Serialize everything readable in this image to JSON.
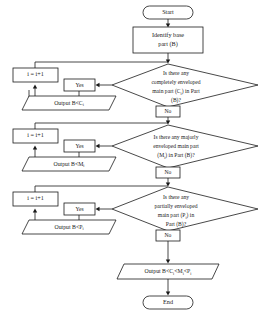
{
  "diagram": {
    "colors": {
      "stroke": "#1a1a1a",
      "fill": "#ffffff",
      "text": "#1a1a1a"
    }
  },
  "nodes": {
    "start": {
      "label": "Start"
    },
    "identify": {
      "line1": "Identify  base",
      "line2": "part (B)"
    },
    "decision1": {
      "line1": "Is  there  any",
      "line2": "completely   enveloped",
      "line3": "main part (C",
      "line3_sub": "i",
      "line3_end": ") in Part",
      "line4": "(B)?"
    },
    "decision2": {
      "line1": "Is  there  any  majorly",
      "line2": "enveloped   main  part",
      "line3": "(M",
      "line3_sub": "i",
      "line3_end": ") in Part (B)?"
    },
    "decision3": {
      "line1": "Is  there  any",
      "line2": "partially   enveloped",
      "line3": "main  part  (P",
      "line3_sub": "i",
      "line3_end": ")  in",
      "line4": "Part (B)?"
    },
    "increment1": {
      "label": "i = i+1"
    },
    "increment2": {
      "label": "i = i+1"
    },
    "increment3": {
      "label": "i = i+1"
    },
    "output1": {
      "label": "Output  B<C",
      "sub": "i"
    },
    "output2": {
      "label": "Output  B<M",
      "sub": "i"
    },
    "output3": {
      "label": "Output  B<P",
      "sub": "i"
    },
    "output_final": {
      "part1": "Output B<C",
      "sub1": "i",
      "part2": "<M",
      "sub2": "i",
      "part3": "<P",
      "sub3": "i"
    },
    "end": {
      "label": "End"
    }
  },
  "edge_labels": {
    "yes1": "Yes",
    "no1": "No",
    "yes2": "Yes",
    "no2": "No",
    "yes3": "Yes",
    "no3": "No"
  }
}
